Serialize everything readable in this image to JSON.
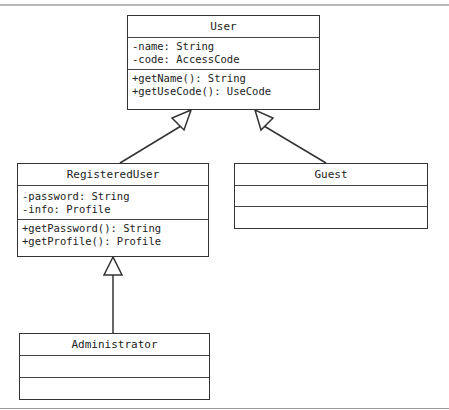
{
  "diagram": {
    "type": "UML class diagram",
    "classes": [
      {
        "name": "User",
        "attributes": [
          "-name: String",
          "-code: AccessCode"
        ],
        "methods": [
          "+getName(): String",
          "+getUseCode(): UseCode"
        ]
      },
      {
        "name": "RegisteredUser",
        "attributes": [
          "-password: String",
          "-info: Profile"
        ],
        "methods": [
          "+getPassword(): String",
          "+getProfile(): Profile"
        ]
      },
      {
        "name": "Guest",
        "attributes": [],
        "methods": []
      },
      {
        "name": "Administrator",
        "attributes": [],
        "methods": []
      }
    ],
    "relationships": [
      {
        "type": "generalization",
        "from": "RegisteredUser",
        "to": "User"
      },
      {
        "type": "generalization",
        "from": "Guest",
        "to": "User"
      },
      {
        "type": "generalization",
        "from": "Administrator",
        "to": "RegisteredUser"
      }
    ]
  }
}
